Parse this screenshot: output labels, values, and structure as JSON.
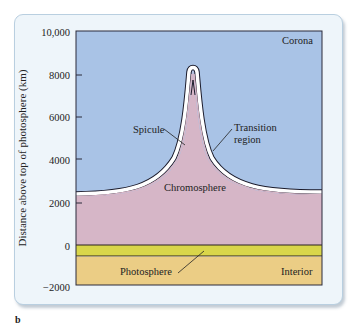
{
  "figure": {
    "panel_letter": "b",
    "y_axis": {
      "label": "Distance above top of photosphere (km)",
      "ticks": [
        "10,000",
        "8000",
        "6000",
        "4000",
        "2000",
        "0",
        "−2000"
      ],
      "tick_values": [
        10000,
        8000,
        6000,
        4000,
        2000,
        0,
        -2000
      ]
    },
    "regions": {
      "corona": "Corona",
      "spicule": "Spicule",
      "transition_line1": "Transition",
      "transition_line2": "region",
      "chromosphere": "Chromosphere",
      "photosphere": "Photosphere",
      "interior": "Interior"
    },
    "colors": {
      "corona": "#a9c3e6",
      "chromosphere": "#d6b6c7",
      "photosphere_band": "#d9d64a",
      "interior": "#ebcd85",
      "transition": "#ffffff",
      "card_bg": "#eef5fa"
    }
  }
}
